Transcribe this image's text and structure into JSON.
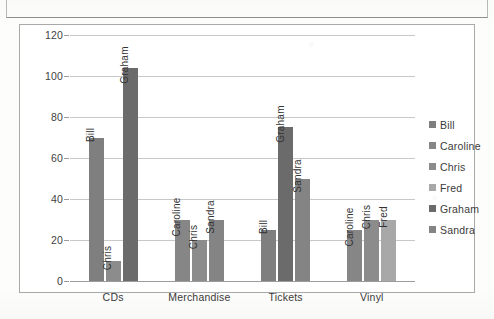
{
  "chart_data": {
    "type": "bar",
    "title": "",
    "xlabel": "",
    "ylabel": "",
    "ylim": [
      0,
      120
    ],
    "yticks": [
      0,
      20,
      40,
      60,
      80,
      100,
      120
    ],
    "grid": true,
    "legend_position": "right",
    "categories": [
      "CDs",
      "Merchandise",
      "Tickets",
      "Vinyl"
    ],
    "legend": [
      "Bill",
      "Caroline",
      "Chris",
      "Fred",
      "Graham",
      "Sandra"
    ],
    "series_colors": {
      "Bill": "#7f7f7f",
      "Caroline": "#868686",
      "Chris": "#8c8c8c",
      "Fred": "#a8a8a8",
      "Graham": "#6b6b6b",
      "Sandra": "#848484"
    },
    "groups": [
      {
        "category": "CDs",
        "bars": [
          {
            "name": "Bill",
            "value": 70,
            "color": "#7f7f7f"
          },
          {
            "name": "Chris",
            "value": 10,
            "color": "#8c8c8c"
          },
          {
            "name": "Graham",
            "value": 104,
            "color": "#6b6b6b"
          }
        ]
      },
      {
        "category": "Merchandise",
        "bars": [
          {
            "name": "Caroline",
            "value": 30,
            "color": "#868686"
          },
          {
            "name": "Chris",
            "value": 20,
            "color": "#8c8c8c"
          },
          {
            "name": "Sandra",
            "value": 30,
            "color": "#848484"
          }
        ]
      },
      {
        "category": "Tickets",
        "bars": [
          {
            "name": "Bill",
            "value": 25,
            "color": "#7f7f7f"
          },
          {
            "name": "Graham",
            "value": 75,
            "color": "#6b6b6b"
          },
          {
            "name": "Sandra",
            "value": 50,
            "color": "#848484"
          }
        ]
      },
      {
        "category": "Vinyl",
        "bars": [
          {
            "name": "Caroline",
            "value": 25,
            "color": "#868686"
          },
          {
            "name": "Chris",
            "value": 30,
            "color": "#8c8c8c"
          },
          {
            "name": "Fred",
            "value": 30,
            "color": "#a8a8a8"
          }
        ]
      }
    ]
  },
  "axis": {
    "tick_120": "120",
    "tick_100": "100",
    "tick_80": "80",
    "tick_60": "60",
    "tick_40": "40",
    "tick_20": "20",
    "tick_0": "0"
  },
  "categories": {
    "c0": "CDs",
    "c1": "Merchandise",
    "c2": "Tickets",
    "c3": "Vinyl"
  },
  "legend": {
    "l0": "Bill",
    "l1": "Caroline",
    "l2": "Chris",
    "l3": "Fred",
    "l4": "Graham",
    "l5": "Sandra"
  }
}
